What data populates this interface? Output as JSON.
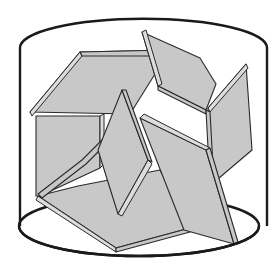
{
  "figure": {
    "colors": {
      "background": "#ffffff",
      "outline": "#1a1a1a",
      "plate_face": "#c8c8c8",
      "plate_edge": "#dcdcdc"
    },
    "cylinder": {
      "top_ellipse": {
        "cx": 139,
        "cy": 48,
        "rx": 118,
        "ry": 28
      },
      "bottom_ellipse": {
        "cx": 139,
        "cy": 226,
        "rx": 120,
        "ry": 30
      },
      "left_x": 20,
      "right_x": 267,
      "top_y": 48,
      "bottom_y": 226
    },
    "plates": [
      {
        "name": "bottom-plate",
        "face": "38,196 78,186 160,170 190,228 116,248",
        "edge": "38,196 116,248 116,252 36,200"
      },
      {
        "name": "bottom-plate-front-edge",
        "face": "116,248 190,228 190,232 116,252",
        "edge": ""
      },
      {
        "name": "left-vertical-plate",
        "face": "36,116 100,116 100,168 40,196 36,196",
        "edge": "100,116 104,114 104,164 100,168"
      },
      {
        "name": "left-diagonal-rail",
        "face": "38,194 82,160 102,140 106,144 86,164 42,198",
        "edge": ""
      },
      {
        "name": "upper-left-plate",
        "face": "30,112 80,52 170,50 130,114",
        "edge": "30,112 80,52 82,56 32,116"
      },
      {
        "name": "upper-left-plate-top-edge",
        "face": "80,52 170,50 170,56 82,56",
        "edge": ""
      },
      {
        "name": "center-diamond",
        "face": "122,90 98,150 118,214 148,160",
        "edge": "148,160 152,164 122,216 118,214"
      },
      {
        "name": "center-diamond-right-edge",
        "face": "122,90 126,90 152,162 148,160",
        "edge": ""
      },
      {
        "name": "top-right-plate",
        "face": "142,32 200,58 216,84 206,110 158,86",
        "edge": "142,32 146,30 162,84 158,86"
      },
      {
        "name": "top-right-plate-bottom-edge",
        "face": "158,86 206,110 206,114 158,90",
        "edge": ""
      },
      {
        "name": "right-vertical-plate",
        "face": "208,108 246,64 252,150 212,184",
        "edge": "208,108 246,64 248,68 210,112"
      },
      {
        "name": "right-vertical-plate-left-edge",
        "face": "206,110 210,112 214,184 210,186",
        "edge": ""
      },
      {
        "name": "lower-right-plate",
        "face": "140,118 206,150 234,244 184,230 158,164",
        "edge": "140,118 144,114 210,148 206,150"
      },
      {
        "name": "lower-right-plate-right-edge",
        "face": "206,150 210,148 238,242 234,244",
        "edge": ""
      }
    ]
  }
}
